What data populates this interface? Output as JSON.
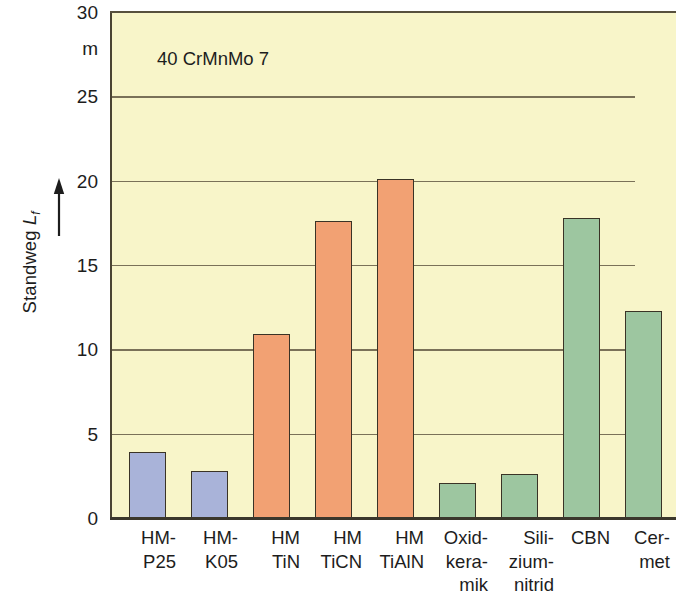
{
  "chart_data": {
    "type": "bar",
    "title": "40 CrMnMo 7",
    "xlabel": "",
    "ylabel": "Standweg L_f",
    "ylabel_main": "Standweg",
    "ylabel_symbol": "L",
    "ylabel_symbol_sub": "f",
    "yunit": "m",
    "ylim": [
      0,
      30
    ],
    "yticks": [
      0,
      5,
      10,
      15,
      20,
      25,
      30
    ],
    "ytick_labels": [
      "0",
      "5",
      "10",
      "15",
      "20",
      "25",
      "30"
    ],
    "grid": true,
    "grid_axis": "y",
    "legend": "none",
    "categories": [
      "HM-P25",
      "HM-K05",
      "HM TiN",
      "HM TiCN",
      "HM TiAlN",
      "Oxidkeramik",
      "Siliziumnitrid",
      "CBN",
      "Cermet"
    ],
    "category_label_lines": [
      [
        "HM-",
        "P25"
      ],
      [
        "HM-",
        "K05"
      ],
      [
        "HM",
        "TiN"
      ],
      [
        "HM",
        "TiCN"
      ],
      [
        "HM",
        "TiAlN"
      ],
      [
        "Oxid-",
        "kera-",
        "mik"
      ],
      [
        "Sili-",
        "zium-",
        "nitrid"
      ],
      [
        "CBN"
      ],
      [
        "Cer-",
        "met"
      ]
    ],
    "values": [
      3.9,
      2.8,
      10.9,
      17.6,
      20.1,
      2.1,
      2.6,
      17.8,
      12.3
    ],
    "bar_colors": [
      "#a9b3d9",
      "#a9b3d9",
      "#f2a173",
      "#f2a173",
      "#f2a173",
      "#9dc6a0",
      "#9dc6a0",
      "#9dc6a0",
      "#9dc6a0"
    ],
    "series": [
      {
        "name": "Standweg Lf",
        "values": [
          3.9,
          2.8,
          10.9,
          17.6,
          20.1,
          2.1,
          2.6,
          17.8,
          12.3
        ]
      }
    ],
    "colors": {
      "plot_background": "#f8f5c9",
      "axis": "#3b372c",
      "gridline": "#7a7158",
      "bar_blue": "#a9b3d9",
      "bar_orange": "#f2a173",
      "bar_green": "#9dc6a0",
      "text": "#1d1d1d"
    }
  }
}
